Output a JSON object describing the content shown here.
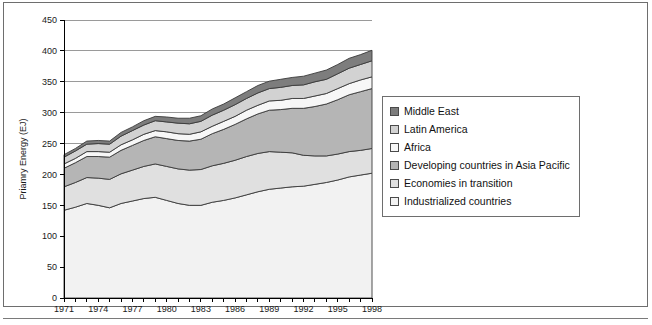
{
  "chart_data": {
    "type": "area",
    "stacked": true,
    "title": "",
    "xlabel": "",
    "ylabel": "Priamry Energy (EJ)",
    "x": [
      1971,
      1972,
      1973,
      1974,
      1975,
      1976,
      1977,
      1978,
      1979,
      1980,
      1981,
      1982,
      1983,
      1984,
      1985,
      1986,
      1987,
      1988,
      1989,
      1990,
      1991,
      1992,
      1993,
      1994,
      1995,
      1996,
      1997,
      1998
    ],
    "xlim": [
      1971,
      1998
    ],
    "ylim": [
      0,
      450
    ],
    "yticks": [
      0,
      50,
      100,
      150,
      200,
      250,
      300,
      350,
      400,
      450
    ],
    "xtick_labels": [
      "1971",
      "1974",
      "1977",
      "1980",
      "1983",
      "1986",
      "1989",
      "1992",
      "1995",
      "1998"
    ],
    "xtick_values": [
      1971,
      1974,
      1977,
      1980,
      1983,
      1986,
      1989,
      1992,
      1995,
      1998
    ],
    "grid": "horizontal",
    "legend_position": "right",
    "stack_order_bottom_to_top": [
      "Industrialized countries",
      "Economies in transition",
      "Developing countries in Asia Pacific",
      "Africa",
      "Latin America",
      "Middle East"
    ],
    "series": [
      {
        "name": "Industrialized countries",
        "color": "#f2f2f2",
        "values": [
          142,
          147,
          153,
          150,
          146,
          153,
          157,
          161,
          163,
          158,
          153,
          150,
          150,
          155,
          158,
          162,
          167,
          172,
          176,
          178,
          180,
          181,
          184,
          187,
          191,
          196,
          199,
          202
        ]
      },
      {
        "name": "Economies in transition",
        "color": "#e0e0e0",
        "values": [
          38,
          40,
          42,
          44,
          46,
          48,
          50,
          52,
          54,
          55,
          56,
          57,
          58,
          59,
          60,
          61,
          62,
          62,
          61,
          58,
          55,
          50,
          46,
          43,
          42,
          41,
          40,
          40
        ]
      },
      {
        "name": "Developing countries in Asia Pacific",
        "color": "#b5b5b5",
        "values": [
          30,
          32,
          34,
          35,
          36,
          38,
          40,
          42,
          44,
          45,
          46,
          47,
          49,
          52,
          55,
          58,
          61,
          64,
          67,
          69,
          72,
          76,
          80,
          84,
          88,
          92,
          95,
          97
        ]
      },
      {
        "name": "Africa",
        "color": "#f7f7f7",
        "values": [
          7,
          7,
          8,
          8,
          8,
          9,
          9,
          10,
          10,
          11,
          11,
          11,
          12,
          12,
          13,
          13,
          14,
          14,
          15,
          15,
          16,
          16,
          17,
          17,
          18,
          18,
          19,
          19
        ]
      },
      {
        "name": "Latin America",
        "color": "#d2d2d2",
        "values": [
          11,
          12,
          12,
          13,
          13,
          14,
          15,
          15,
          16,
          16,
          17,
          17,
          17,
          18,
          18,
          19,
          19,
          20,
          20,
          21,
          21,
          22,
          23,
          23,
          24,
          25,
          25,
          26
        ]
      },
      {
        "name": "Middle East",
        "color": "#7d7d7d",
        "values": [
          4,
          4,
          5,
          5,
          5,
          6,
          6,
          7,
          7,
          8,
          8,
          9,
          9,
          10,
          10,
          11,
          11,
          12,
          12,
          13,
          13,
          14,
          14,
          15,
          15,
          16,
          16,
          17
        ]
      }
    ],
    "totals": [
      232,
      242,
      254,
      255,
      254,
      268,
      277,
      287,
      294,
      293,
      291,
      291,
      295,
      306,
      314,
      324,
      334,
      344,
      351,
      354,
      357,
      359,
      364,
      369,
      378,
      388,
      394,
      401
    ]
  },
  "legend": {
    "items": [
      {
        "label": "Middle East",
        "color": "#7d7d7d"
      },
      {
        "label": "Latin America",
        "color": "#d2d2d2"
      },
      {
        "label": "Africa",
        "color": "#f7f7f7"
      },
      {
        "label": "Developing countries in Asia Pacific",
        "color": "#b5b5b5"
      },
      {
        "label": "Economies in transition",
        "color": "#e0e0e0"
      },
      {
        "label": "Industrialized countries",
        "color": "#f2f2f2"
      }
    ]
  }
}
